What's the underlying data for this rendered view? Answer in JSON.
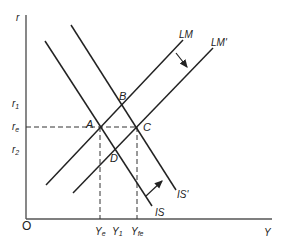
{
  "diagram": {
    "type": "IS-LM",
    "axes": {
      "y_label": "r",
      "x_label": "Y",
      "origin_label": "O"
    },
    "y_ticks": [
      {
        "label": "r",
        "sub": "1",
        "y": 105
      },
      {
        "label": "r",
        "sub": "e",
        "y": 128
      },
      {
        "label": "r",
        "sub": "2",
        "y": 151
      }
    ],
    "x_ticks": [
      {
        "label": "Y",
        "sub": "e",
        "x": 100
      },
      {
        "label": "Y",
        "sub": "1",
        "x": 116
      },
      {
        "label": "Y",
        "sub": "fe",
        "x": 137
      }
    ],
    "curves": [
      {
        "name": "LM",
        "label": "LM"
      },
      {
        "name": "LM-prime",
        "label": "LM'"
      },
      {
        "name": "IS",
        "label": "IS"
      },
      {
        "name": "IS-prime",
        "label": "IS'"
      }
    ],
    "points": [
      {
        "label": "A"
      },
      {
        "label": "B"
      },
      {
        "label": "C"
      },
      {
        "label": "D"
      }
    ]
  }
}
